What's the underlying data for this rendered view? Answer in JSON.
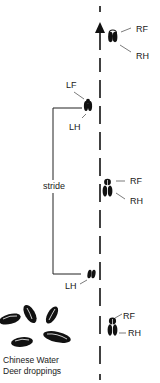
{
  "diagram": {
    "direction": "up",
    "colors": {
      "ink": "#111111",
      "background": "#ffffff"
    },
    "prints": [
      {
        "id": "pair-1",
        "type": "front-hind overlap",
        "side": "right",
        "labels": [
          "RF",
          "RH"
        ]
      },
      {
        "id": "left-1",
        "type": "front-hind overlap",
        "side": "left",
        "labels": [
          "LF",
          "LH"
        ]
      },
      {
        "id": "pair-2",
        "type": "front-hind overlap",
        "side": "right",
        "labels": [
          "RF",
          "RH"
        ]
      },
      {
        "id": "left-2",
        "type": "hind",
        "side": "left",
        "labels": [
          "LH"
        ]
      },
      {
        "id": "pair-3",
        "type": "front-hind overlap",
        "side": "right",
        "labels": [
          "RF",
          "RH"
        ]
      }
    ],
    "stride_label": "stride",
    "droppings": {
      "count": 5,
      "caption_line1": "Chinese Water",
      "caption_line2": "Deer droppings"
    }
  }
}
